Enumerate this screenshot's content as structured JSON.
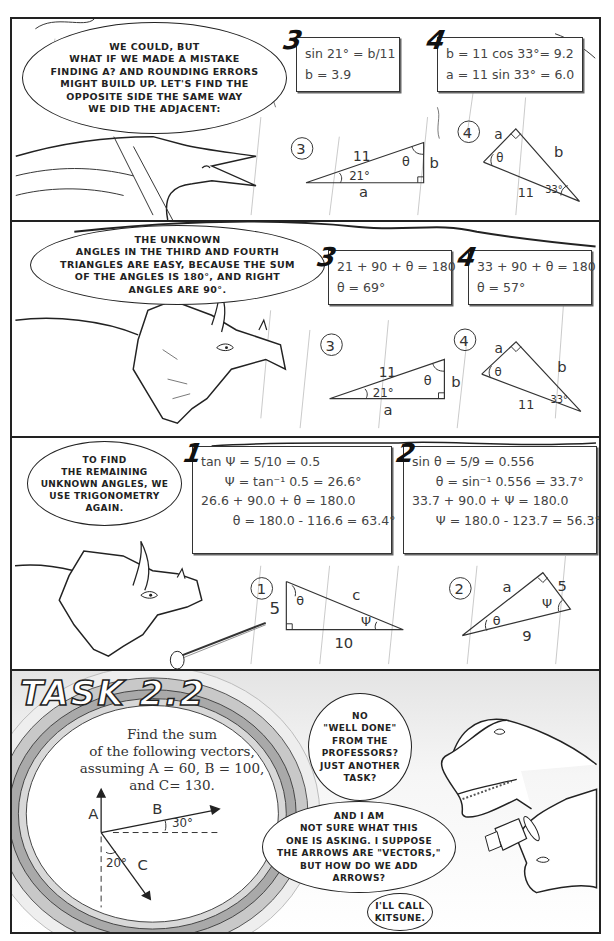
{
  "panels": [
    {
      "id": "panel-1",
      "speech": "We could, but\nwhat if we made a mistake\nfinding a? And rounding errors\nmight build up. Let's find the\nopposite side the same way\nwe did the adjacent:",
      "calc_boxes": [
        {
          "number": "3",
          "lines": [
            "sin 21° = b/11",
            "b = 3.9"
          ]
        },
        {
          "number": "4",
          "lines": [
            "b = 11 cos 33°= 9.2",
            "a = 11 sin 33° = 6.0"
          ]
        }
      ],
      "triangles": [
        {
          "label": "3",
          "hyp": "11",
          "opp": "b",
          "adj": "a",
          "angle1": "21°",
          "angle2": "θ"
        },
        {
          "label": "4",
          "hyp": "11",
          "opp": "b",
          "adj": "a",
          "angle1": "33°",
          "angle2": "θ"
        }
      ]
    },
    {
      "id": "panel-2",
      "speech": "The unknown\nangles in the third and fourth\ntriangles are easy, because the sum\nof the angles is 180°, and right\nangles are 90°.",
      "calc_boxes": [
        {
          "number": "3",
          "lines": [
            "21 + 90 + θ = 180",
            "θ = 69°"
          ]
        },
        {
          "number": "4",
          "lines": [
            "33 + 90 + θ = 180",
            "θ = 57°"
          ]
        }
      ],
      "triangles": [
        {
          "label": "3",
          "hyp": "11",
          "opp": "b",
          "adj": "a",
          "angle1": "21°",
          "angle2": "θ"
        },
        {
          "label": "4",
          "hyp": "11",
          "opp": "b",
          "adj": "a",
          "angle1": "33°",
          "angle2": "θ"
        }
      ]
    },
    {
      "id": "panel-3",
      "speech": "To find\nthe remaining\nunknown angles, we\nuse trigonometry\nagain.",
      "calc_boxes": [
        {
          "number": "1",
          "lines": [
            "tan Ψ = 5/10 = 0.5",
            "      Ψ = tan⁻¹ 0.5 = 26.6°",
            "",
            "26.6 + 90.0 + θ = 180.0",
            "        θ = 180.0 - 116.6 = 63.4°"
          ]
        },
        {
          "number": "2",
          "lines": [
            "sin θ = 5/9 = 0.556",
            "      θ = sin⁻¹ 0.556 = 33.7°",
            "",
            "33.7 + 90.0 + Ψ = 180.0",
            "      Ψ = 180.0 - 123.7 = 56.3°"
          ]
        }
      ],
      "triangles": [
        {
          "label": "1",
          "side1": "5",
          "side2": "10",
          "hyp": "c",
          "angle1": "θ",
          "angle2": "Ψ"
        },
        {
          "label": "2",
          "side1": "a",
          "side2": "5",
          "hyp": "9",
          "angle1": "θ",
          "angle2": "Ψ"
        }
      ]
    },
    {
      "id": "panel-4",
      "title": "TASK 2.2",
      "task_text": "Find the sum\nof the following vectors,\nassuming A = 60, B = 100,\nand C= 130.",
      "vectors": {
        "A": "A",
        "B": "B",
        "C": "C",
        "angle_B": "30°",
        "angle_C": "20°"
      },
      "speech": [
        "No\n\"well done\"\nfrom the\nprofessors?\nJust another\ntask?",
        "And I am\nnot sure what this\none is asking. I suppose\nthe arrows are \"vectors,\"\nbut how do we add\narrows?",
        "I'll call\nKitsune."
      ]
    }
  ]
}
